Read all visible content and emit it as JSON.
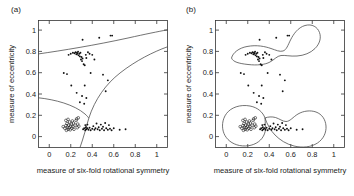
{
  "figure": {
    "panels": [
      {
        "id": "a",
        "label": "(a)",
        "xlabel": "measure of six-fold rotational symmetry",
        "ylabel": "measure of eccentricity",
        "xticks": [
          "0",
          "0.2",
          "0.4",
          "0.6",
          "0.8",
          "1"
        ],
        "yticks": [
          "0",
          "0.2",
          "0.4",
          "0.6",
          "0.8",
          "1"
        ]
      },
      {
        "id": "b",
        "label": "(b)",
        "xlabel": "measure of six-fold rotational symmetry",
        "ylabel": "measure of eccentricity",
        "xticks": [
          "0",
          "0.2",
          "0.4",
          "0.6",
          "0.8",
          "1"
        ],
        "yticks": [
          "0",
          "0.2",
          "0.4",
          "0.6",
          "0.8",
          "1"
        ]
      }
    ]
  },
  "chart_data": [
    {
      "type": "scatter",
      "panel": "a",
      "title": "(a)",
      "xlabel": "measure of six-fold rotational symmetry",
      "ylabel": "measure of eccentricity",
      "xlim": [
        -0.1,
        1.1
      ],
      "ylim": [
        -0.1,
        1.12
      ],
      "xticks": [
        0,
        0.2,
        0.4,
        0.6,
        0.8,
        1
      ],
      "yticks": [
        0,
        0.2,
        0.4,
        0.6,
        0.8,
        1
      ],
      "grid": false,
      "legend": "none",
      "series": [
        {
          "name": "class-high-eccentricity",
          "marker": "dot",
          "points": [
            [
              0.18,
              0.79
            ],
            [
              0.2,
              0.8
            ],
            [
              0.22,
              0.81
            ],
            [
              0.235,
              0.805
            ],
            [
              0.245,
              0.815
            ],
            [
              0.252,
              0.795
            ],
            [
              0.258,
              0.81
            ],
            [
              0.262,
              0.8
            ],
            [
              0.268,
              0.82
            ],
            [
              0.272,
              0.785
            ],
            [
              0.28,
              0.8
            ],
            [
              0.285,
              0.775
            ],
            [
              0.29,
              0.81
            ],
            [
              0.295,
              0.745
            ],
            [
              0.3,
              0.77
            ],
            [
              0.305,
              0.73
            ],
            [
              0.31,
              0.755
            ],
            [
              0.32,
              0.7
            ],
            [
              0.33,
              0.69
            ],
            [
              0.34,
              0.79
            ],
            [
              0.345,
              0.76
            ],
            [
              0.36,
              0.815
            ],
            [
              0.375,
              0.8
            ],
            [
              0.4,
              0.79
            ],
            [
              0.42,
              0.745
            ],
            [
              0.31,
              0.935
            ],
            [
              0.465,
              0.955
            ],
            [
              0.57,
              0.975
            ],
            [
              0.585,
              0.975
            ],
            [
              0.135,
              0.615
            ],
            [
              0.165,
              0.605
            ],
            [
              0.385,
              0.615
            ],
            [
              0.5,
              0.6
            ],
            [
              0.205,
              0.495
            ],
            [
              0.33,
              0.495
            ],
            [
              0.255,
              0.425
            ],
            [
              0.525,
              0.44
            ],
            [
              0.305,
              0.395
            ],
            [
              0.285,
              0.335
            ],
            [
              0.345,
              0.375
            ],
            [
              0.545,
              0.545
            ],
            [
              0.325,
              0.32
            ]
          ]
        },
        {
          "name": "class-low-eccentricity-circles",
          "marker": "circle",
          "points": [
            [
              0.145,
              0.085
            ],
            [
              0.155,
              0.11
            ],
            [
              0.16,
              0.065
            ],
            [
              0.165,
              0.13
            ],
            [
              0.17,
              0.095
            ],
            [
              0.175,
              0.075
            ],
            [
              0.18,
              0.115
            ],
            [
              0.185,
              0.09
            ],
            [
              0.19,
              0.145
            ],
            [
              0.195,
              0.07
            ],
            [
              0.2,
              0.105
            ],
            [
              0.205,
              0.125
            ],
            [
              0.21,
              0.085
            ],
            [
              0.215,
              0.155
            ],
            [
              0.22,
              0.1
            ],
            [
              0.225,
              0.135
            ],
            [
              0.23,
              0.075
            ],
            [
              0.24,
              0.115
            ],
            [
              0.25,
              0.16
            ],
            [
              0.255,
              0.175
            ],
            [
              0.26,
              0.09
            ],
            [
              0.265,
              0.125
            ],
            [
              0.27,
              0.185
            ],
            [
              0.275,
              0.105
            ],
            [
              0.155,
              0.16
            ],
            [
              0.175,
              0.17
            ],
            [
              0.13,
              0.1
            ]
          ]
        },
        {
          "name": "class-low-eccentricity-dots",
          "marker": "dot",
          "points": [
            [
              0.315,
              0.075
            ],
            [
              0.325,
              0.085
            ],
            [
              0.335,
              0.065
            ],
            [
              0.34,
              0.095
            ],
            [
              0.345,
              0.075
            ],
            [
              0.355,
              0.085
            ],
            [
              0.365,
              0.07
            ],
            [
              0.375,
              0.09
            ],
            [
              0.385,
              0.065
            ],
            [
              0.4,
              0.08
            ],
            [
              0.41,
              0.105
            ],
            [
              0.42,
              0.07
            ],
            [
              0.43,
              0.085
            ],
            [
              0.44,
              0.13
            ],
            [
              0.45,
              0.075
            ],
            [
              0.46,
              0.095
            ],
            [
              0.47,
              0.065
            ],
            [
              0.48,
              0.12
            ],
            [
              0.49,
              0.08
            ],
            [
              0.5,
              0.1
            ],
            [
              0.51,
              0.065
            ],
            [
              0.52,
              0.135
            ],
            [
              0.53,
              0.085
            ],
            [
              0.545,
              0.07
            ],
            [
              0.555,
              0.115
            ],
            [
              0.565,
              0.08
            ],
            [
              0.58,
              0.065
            ],
            [
              0.6,
              0.085
            ],
            [
              0.655,
              0.07
            ],
            [
              0.71,
              0.075
            ],
            [
              0.335,
              0.115
            ],
            [
              0.355,
              0.12
            ]
          ]
        }
      ],
      "boundaries": [
        {
          "name": "upper-linear-boundary",
          "description": "gently rising curve from left edge y~0.695 to right edge y~0.96"
        },
        {
          "name": "lower-left-boundary",
          "description": "curve from left edge y~0.285 descending to about (0.38, 0.20)"
        },
        {
          "name": "lower-right-boundary",
          "description": "curve rising from about (0.30, -0.08) through (0.38, 0.20) to right edge y~0.59"
        }
      ]
    },
    {
      "type": "scatter",
      "panel": "b",
      "title": "(b)",
      "xlabel": "measure of six-fold rotational symmetry",
      "ylabel": "measure of eccentricity",
      "xlim": [
        -0.1,
        1.1
      ],
      "ylim": [
        -0.1,
        1.12
      ],
      "xticks": [
        0,
        0.2,
        0.4,
        0.6,
        0.8,
        1
      ],
      "yticks": [
        0,
        0.2,
        0.4,
        0.6,
        0.8,
        1
      ],
      "grid": false,
      "legend": "none",
      "series": [
        {
          "name": "class-high-eccentricity",
          "marker": "dot",
          "points": [
            [
              0.18,
              0.79
            ],
            [
              0.2,
              0.8
            ],
            [
              0.22,
              0.81
            ],
            [
              0.235,
              0.805
            ],
            [
              0.245,
              0.815
            ],
            [
              0.252,
              0.795
            ],
            [
              0.258,
              0.81
            ],
            [
              0.262,
              0.8
            ],
            [
              0.268,
              0.82
            ],
            [
              0.272,
              0.785
            ],
            [
              0.28,
              0.8
            ],
            [
              0.285,
              0.775
            ],
            [
              0.29,
              0.81
            ],
            [
              0.295,
              0.745
            ],
            [
              0.3,
              0.77
            ],
            [
              0.305,
              0.73
            ],
            [
              0.31,
              0.755
            ],
            [
              0.32,
              0.7
            ],
            [
              0.33,
              0.69
            ],
            [
              0.34,
              0.79
            ],
            [
              0.345,
              0.76
            ],
            [
              0.36,
              0.815
            ],
            [
              0.375,
              0.8
            ],
            [
              0.4,
              0.79
            ],
            [
              0.42,
              0.745
            ],
            [
              0.31,
              0.935
            ],
            [
              0.465,
              0.955
            ],
            [
              0.57,
              0.975
            ],
            [
              0.585,
              0.975
            ],
            [
              0.135,
              0.615
            ],
            [
              0.165,
              0.605
            ],
            [
              0.385,
              0.615
            ],
            [
              0.5,
              0.6
            ],
            [
              0.205,
              0.495
            ],
            [
              0.33,
              0.495
            ],
            [
              0.255,
              0.425
            ],
            [
              0.525,
              0.44
            ],
            [
              0.305,
              0.395
            ],
            [
              0.285,
              0.335
            ],
            [
              0.345,
              0.375
            ],
            [
              0.545,
              0.545
            ],
            [
              0.325,
              0.32
            ]
          ]
        },
        {
          "name": "class-low-eccentricity-circles",
          "marker": "circle",
          "points": [
            [
              0.145,
              0.085
            ],
            [
              0.155,
              0.11
            ],
            [
              0.16,
              0.065
            ],
            [
              0.165,
              0.13
            ],
            [
              0.17,
              0.095
            ],
            [
              0.175,
              0.075
            ],
            [
              0.18,
              0.115
            ],
            [
              0.185,
              0.09
            ],
            [
              0.19,
              0.145
            ],
            [
              0.195,
              0.07
            ],
            [
              0.2,
              0.105
            ],
            [
              0.205,
              0.125
            ],
            [
              0.21,
              0.085
            ],
            [
              0.215,
              0.155
            ],
            [
              0.22,
              0.1
            ],
            [
              0.225,
              0.135
            ],
            [
              0.23,
              0.075
            ],
            [
              0.24,
              0.115
            ],
            [
              0.25,
              0.16
            ],
            [
              0.255,
              0.175
            ],
            [
              0.26,
              0.09
            ],
            [
              0.265,
              0.125
            ],
            [
              0.27,
              0.185
            ],
            [
              0.275,
              0.105
            ],
            [
              0.155,
              0.16
            ],
            [
              0.175,
              0.17
            ],
            [
              0.13,
              0.1
            ]
          ]
        },
        {
          "name": "class-low-eccentricity-dots",
          "marker": "dot",
          "points": [
            [
              0.315,
              0.075
            ],
            [
              0.325,
              0.085
            ],
            [
              0.335,
              0.065
            ],
            [
              0.34,
              0.095
            ],
            [
              0.345,
              0.075
            ],
            [
              0.355,
              0.085
            ],
            [
              0.365,
              0.07
            ],
            [
              0.375,
              0.09
            ],
            [
              0.385,
              0.065
            ],
            [
              0.4,
              0.08
            ],
            [
              0.41,
              0.105
            ],
            [
              0.42,
              0.07
            ],
            [
              0.43,
              0.085
            ],
            [
              0.44,
              0.13
            ],
            [
              0.45,
              0.075
            ],
            [
              0.46,
              0.095
            ],
            [
              0.47,
              0.065
            ],
            [
              0.48,
              0.12
            ],
            [
              0.49,
              0.08
            ],
            [
              0.5,
              0.1
            ],
            [
              0.51,
              0.065
            ],
            [
              0.52,
              0.135
            ],
            [
              0.53,
              0.085
            ],
            [
              0.545,
              0.07
            ],
            [
              0.555,
              0.115
            ],
            [
              0.565,
              0.08
            ],
            [
              0.58,
              0.065
            ],
            [
              0.6,
              0.085
            ],
            [
              0.655,
              0.07
            ],
            [
              0.71,
              0.075
            ],
            [
              0.335,
              0.115
            ],
            [
              0.355,
              0.12
            ]
          ]
        }
      ],
      "boundaries": [
        {
          "name": "upper-closed-contour",
          "description": "closed blob enclosing the high-eccentricity cluster, spanning roughly x 0.09-0.68, y 0.68-1.06"
        },
        {
          "name": "lower-left-closed-contour",
          "description": "closed blob around the open-circle cluster, roughly x 0.04-0.36, y -0.05-0.26"
        },
        {
          "name": "lower-right-closed-contour",
          "description": "closed blob around the filled-dot cluster, roughly x 0.30-0.83, y -0.06-0.23"
        }
      ]
    }
  ]
}
